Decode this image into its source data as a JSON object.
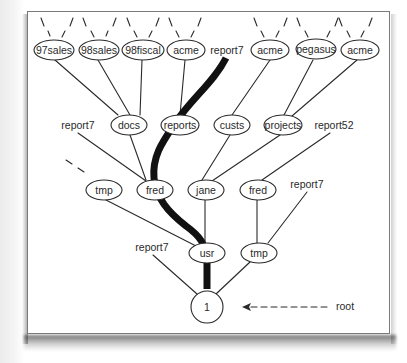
{
  "diagram": {
    "type": "directory-tree",
    "root": {
      "label": "1",
      "annotation": "root"
    },
    "top_row": {
      "nodes": [
        {
          "label": "97sales"
        },
        {
          "label": "98sales"
        },
        {
          "label": "98fiscal"
        },
        {
          "label": "acme"
        },
        {
          "label": "acme"
        },
        {
          "label": "pegasus"
        },
        {
          "label": "acme"
        }
      ],
      "loose_label": "report7"
    },
    "second_row": {
      "left_label": "report7",
      "nodes": [
        {
          "label": "docs"
        },
        {
          "label": "reports"
        },
        {
          "label": "custs"
        },
        {
          "label": "projects"
        }
      ],
      "right_label": "report52"
    },
    "third_row": {
      "nodes": [
        {
          "label": "tmp"
        },
        {
          "label": "fred"
        },
        {
          "label": "jane"
        },
        {
          "label": "fred"
        }
      ],
      "right_label": "report7"
    },
    "fourth_row": {
      "left_label": "report7",
      "nodes": [
        {
          "label": "usr"
        },
        {
          "label": "tmp"
        }
      ]
    },
    "highlighted_path": [
      "1",
      "usr",
      "fred",
      "reports",
      "report7"
    ],
    "colors": {
      "line": "#2a2a2a",
      "highlight_path": "#111111",
      "frame_border": "#7a7a7a",
      "background": "#ffffff"
    }
  }
}
